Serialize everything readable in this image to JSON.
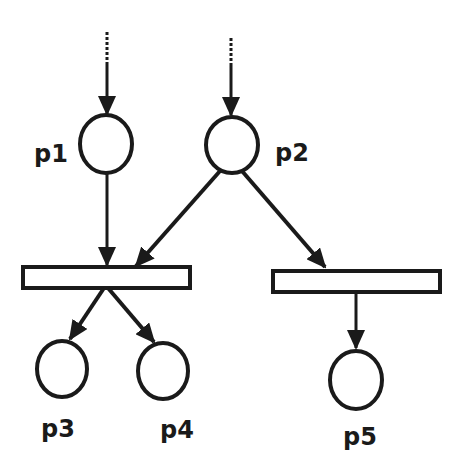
{
  "diagram": {
    "type": "petri-net",
    "colors": {
      "stroke": "#1a1a1a",
      "background": "#ffffff"
    },
    "places": [
      {
        "id": "p1",
        "label": "p1"
      },
      {
        "id": "p2",
        "label": "p2"
      },
      {
        "id": "p3",
        "label": "p3"
      },
      {
        "id": "p4",
        "label": "p4"
      },
      {
        "id": "p5",
        "label": "p5"
      }
    ],
    "transitions": [
      {
        "id": "t1",
        "inputs": [
          "p1",
          "p2"
        ],
        "outputs": [
          "p3",
          "p4"
        ]
      },
      {
        "id": "t2",
        "inputs": [
          "p2"
        ],
        "outputs": [
          "p5"
        ]
      }
    ],
    "external_inputs": [
      "p1",
      "p2"
    ]
  }
}
